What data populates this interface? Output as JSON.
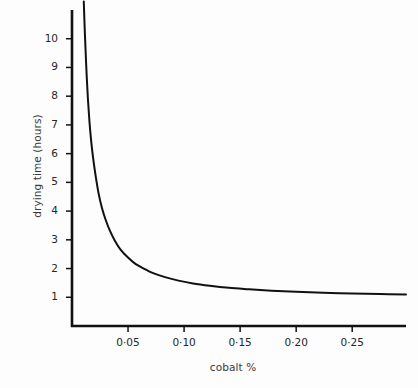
{
  "chart_data": {
    "type": "line",
    "title": "",
    "xlabel": "cobalt %",
    "ylabel": "drying time (hours)",
    "xlim": [
      0.0,
      0.298
    ],
    "ylim": [
      0.0,
      11.0
    ],
    "grid": false,
    "legend": "none",
    "xticks": [
      0.05,
      0.1,
      0.15,
      0.2,
      0.25
    ],
    "xtick_labels": [
      "0·05",
      "0·10",
      "0·15",
      "0·20",
      "0·25"
    ],
    "yticks": [
      1,
      2,
      3,
      4,
      5,
      6,
      7,
      8,
      9,
      10
    ],
    "ytick_labels": [
      "1",
      "2",
      "3",
      "4",
      "5",
      "6",
      "7",
      "8",
      "9",
      "10"
    ],
    "series": [
      {
        "name": "drying time vs cobalt",
        "color": "#111111",
        "x": [
          0.0105,
          0.0112,
          0.012,
          0.013,
          0.0142,
          0.0156,
          0.0172,
          0.019,
          0.0212,
          0.0238,
          0.0268,
          0.03,
          0.034,
          0.0385,
          0.0435,
          0.0495,
          0.056,
          0.064,
          0.073,
          0.083,
          0.095,
          0.108,
          0.123,
          0.14,
          0.158,
          0.178,
          0.2,
          0.224,
          0.25,
          0.275,
          0.298
        ],
        "y": [
          11.3,
          10.5,
          9.7,
          8.8,
          7.9,
          7.1,
          6.4,
          5.8,
          5.2,
          4.6,
          4.1,
          3.7,
          3.3,
          2.95,
          2.65,
          2.4,
          2.18,
          2.0,
          1.83,
          1.7,
          1.58,
          1.48,
          1.4,
          1.33,
          1.28,
          1.23,
          1.19,
          1.16,
          1.13,
          1.11,
          1.1
        ]
      }
    ],
    "axis_color": "#111111",
    "background": "#fdfdfd"
  },
  "geometry": {
    "x_origin_px": 72,
    "y_origin_px": 326,
    "x_right_px": 406,
    "y_top_px": 10,
    "px_per_x_unit": 1116.0,
    "px_per_y_unit": 28.9
  }
}
